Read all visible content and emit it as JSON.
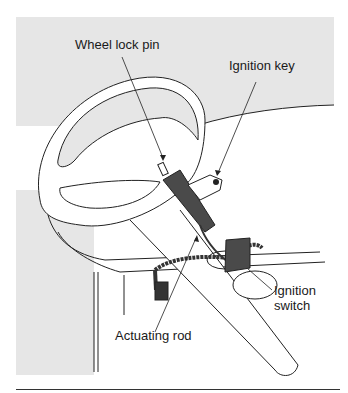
{
  "figure": {
    "labels": {
      "wheel_lock_pin": "Wheel lock pin",
      "ignition_key": "Ignition key",
      "ignition_switch_line1": "Ignition",
      "ignition_switch_line2": "switch",
      "actuating_rod": "Actuating rod"
    },
    "colors": {
      "background_panel": "#e6e6e6",
      "line": "#222222",
      "component_dark": "#4a4a4a",
      "white": "#ffffff"
    }
  }
}
